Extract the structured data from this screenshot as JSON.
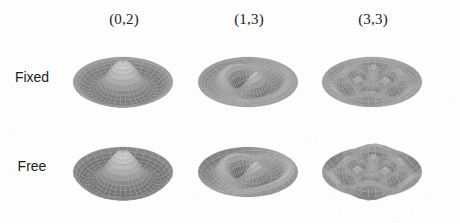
{
  "figure": {
    "title": "",
    "background_color": "#fdfdfd",
    "layout": {
      "rows": 2,
      "cols": 3,
      "type": "grid-of-3d-surface-plots"
    }
  },
  "columns": [
    {
      "label": "(0,2)",
      "mode_m": 0,
      "mode_n": 2
    },
    {
      "label": "(1,3)",
      "mode_m": 1,
      "mode_n": 3
    },
    {
      "label": "(3,3)",
      "mode_m": 3,
      "mode_n": 3
    }
  ],
  "rows": [
    {
      "label": "Fixed",
      "boundary_condition": "clamped"
    },
    {
      "label": "Free",
      "boundary_condition": "free"
    }
  ],
  "chart_data": {
    "type": "surface",
    "title": "",
    "xlabel": "",
    "ylabel": "",
    "grid": true,
    "legend": "none",
    "panels": [
      {
        "row": "Fixed",
        "column": "(0,2)",
        "nodal_diameters": 0,
        "nodal_circles": 2,
        "edge": "clamped",
        "features": "axisymmetric central peak surrounded by a dark annular trough, edge pinned flat",
        "amplitude_range": [
          -1,
          1
        ]
      },
      {
        "row": "Fixed",
        "column": "(1,3)",
        "nodal_diameters": 1,
        "nodal_circles": 3,
        "edge": "clamped",
        "features": "single nodal diameter running diagonally with a deep dark depression at centre and bright adjacent lobes",
        "amplitude_range": [
          -1,
          1
        ]
      },
      {
        "row": "Fixed",
        "column": "(3,3)",
        "nodal_diameters": 3,
        "nodal_circles": 3,
        "edge": "clamped",
        "features": "six alternating bright and dark lobes arranged around three nodal diameters, with concentric banding",
        "amplitude_range": [
          -1,
          1
        ]
      },
      {
        "row": "Free",
        "column": "(0,2)",
        "nodal_diameters": 0,
        "nodal_circles": 2,
        "edge": "free",
        "features": "axisymmetric central peak with a dark trough and an upturned free mesh rim at the boundary",
        "amplitude_range": [
          -1,
          1
        ]
      },
      {
        "row": "Free",
        "column": "(1,3)",
        "nodal_diameters": 1,
        "nodal_circles": 3,
        "edge": "free",
        "features": "one nodal diameter, deep central dark slot, free edge rises into a visible wireframe rim",
        "amplitude_range": [
          -1,
          1
        ]
      },
      {
        "row": "Free",
        "column": "(3,3)",
        "nodal_diameters": 3,
        "nodal_circles": 3,
        "edge": "free",
        "features": "six alternating lobes with strong dark patches, boundary free so rim deflects",
        "amplitude_range": [
          -1,
          1
        ]
      }
    ],
    "colormap": {
      "type": "grayscale-shaded",
      "low": "#3a3a3a",
      "high": "#ffffff"
    },
    "view": {
      "elevation_deg": 30,
      "azimuth_deg": 0,
      "projection": "orthographic"
    }
  }
}
